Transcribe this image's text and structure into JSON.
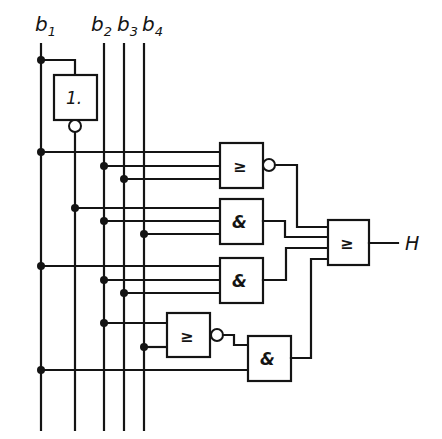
{
  "diagram": {
    "inputs": [
      {
        "id": "b1",
        "label_main": "b",
        "label_sub": "1"
      },
      {
        "id": "b2",
        "label_main": "b",
        "label_sub": "2"
      },
      {
        "id": "b3",
        "label_main": "b",
        "label_sub": "3"
      },
      {
        "id": "b4",
        "label_main": "b",
        "label_sub": "4"
      }
    ],
    "output": {
      "label": "H"
    },
    "gates": [
      {
        "id": "inv",
        "symbol": "1.",
        "type": "NOT",
        "inputs": [
          "b1"
        ],
        "inverted_output": true
      },
      {
        "id": "g1",
        "symbol": "≥",
        "type": "NOR",
        "inputs": [
          "b1",
          "b2",
          "b3"
        ],
        "inverted_output": true
      },
      {
        "id": "g2",
        "symbol": "&",
        "type": "AND",
        "inputs": [
          "not b1",
          "b2",
          "b4"
        ],
        "inverted_output": false
      },
      {
        "id": "g3",
        "symbol": "&",
        "type": "AND",
        "inputs": [
          "b1",
          "b2",
          "b3"
        ],
        "inverted_output": false
      },
      {
        "id": "g4",
        "symbol": "≥",
        "type": "NOR",
        "inputs": [
          "b2",
          "b4"
        ],
        "inverted_output": true
      },
      {
        "id": "g5",
        "symbol": "&",
        "type": "AND",
        "inputs": [
          "g4",
          "b1"
        ],
        "inverted_output": false
      },
      {
        "id": "gout",
        "symbol": "≥",
        "type": "OR",
        "inputs": [
          "g1",
          "g2",
          "g3",
          "g5"
        ],
        "inverted_output": false
      }
    ],
    "colors": {
      "ink": "#141414",
      "background": "#ffffff"
    }
  }
}
